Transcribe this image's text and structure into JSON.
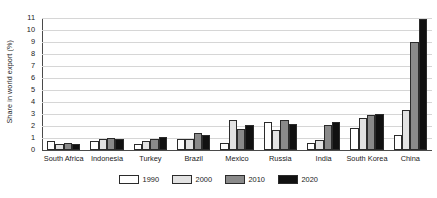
{
  "chart_data": {
    "type": "bar",
    "title": "",
    "xlabel": "",
    "ylabel": "Share in world export (%)",
    "ylim": [
      0,
      11
    ],
    "ytick_step": 1,
    "yticks": [
      "0",
      "1",
      "2",
      "3",
      "4",
      "5",
      "6",
      "7",
      "8",
      "9",
      "10",
      "11"
    ],
    "grid": true,
    "legend_position": "bottom-center",
    "categories": [
      "South Africa",
      "Indonesia",
      "Turkey",
      "Brazil",
      "Mexico",
      "Russia",
      "India",
      "South Korea",
      "China"
    ],
    "series": [
      {
        "name": "1990",
        "color": "#ffffff",
        "values": [
          0.75,
          0.75,
          0.5,
          0.95,
          0.55,
          2.35,
          0.55,
          1.8,
          1.25
        ]
      },
      {
        "name": "2000",
        "color": "#e2e2e2",
        "values": [
          0.5,
          0.95,
          0.75,
          0.95,
          2.5,
          1.65,
          0.85,
          2.7,
          3.35
        ]
      },
      {
        "name": "2010",
        "color": "#8a8a8a",
        "values": [
          0.6,
          1.0,
          0.9,
          1.4,
          1.75,
          2.5,
          2.1,
          2.95,
          9.0
        ]
      },
      {
        "name": "2020",
        "color": "#111111",
        "values": [
          0.5,
          0.9,
          1.05,
          1.25,
          2.1,
          2.15,
          2.3,
          3.0,
          10.9
        ]
      }
    ]
  }
}
